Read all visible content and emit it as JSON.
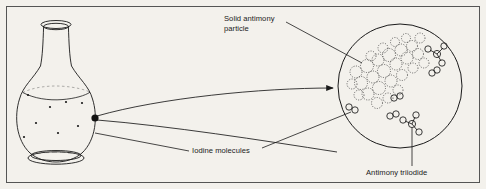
{
  "figure": {
    "background_color": "#f3f1ec",
    "ink_color": "#1a1a1a",
    "border": {
      "name": "figure-border",
      "stroke": "#555555"
    }
  },
  "labels": {
    "solid_antimony": "Solid antimony\nparticle",
    "iodine": "Iodine molecules",
    "antimony_triiodide": "Antimony triiodide"
  },
  "diagram_data": {
    "type": "diagram",
    "subject": "Reaction of iodine with solid antimony in a round-bottom flask, with magnified molecular view",
    "elements": [
      {
        "name": "flask",
        "description": "round-bottom flask with long neck, flared rim, liquid level line and flat elliptical base"
      },
      {
        "name": "antimony-particle-dot",
        "description": "large filled black dot inside flask representing solid antimony particle"
      },
      {
        "name": "iodine-dots",
        "description": "small dots inside flask representing iodine molecules",
        "count": 7
      },
      {
        "name": "magnifier-cone",
        "description": "two curved lines with arrowhead expanding from the antimony dot to the magnified circle"
      },
      {
        "name": "magnified-circle",
        "description": "large circle showing molecular-scale view"
      },
      {
        "name": "antimony-cluster",
        "description": "lattice of overlapping dotted circles in upper-left of magnified circle"
      },
      {
        "name": "iodine-molecules",
        "description": "diatomic pairs of small circles",
        "count": 4
      },
      {
        "name": "antimony-triiodide-molecules",
        "description": "central atom bonded to three surrounding atoms",
        "count": 2
      }
    ],
    "leader_lines": [
      {
        "from": "solid_antimony label",
        "to": "antimony-cluster"
      },
      {
        "from": "iodine label",
        "to": "flask interior"
      },
      {
        "from": "iodine label",
        "to": "iodine molecule in magnified circle"
      },
      {
        "from": "antimony_triiodide label",
        "to": "SbI3 molecule in magnified circle"
      }
    ]
  }
}
